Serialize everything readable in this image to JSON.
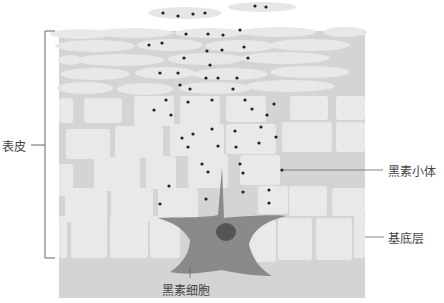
{
  "labels": {
    "epidermis": "表皮",
    "melanosome": "黑素小体",
    "basal_layer": "基底层",
    "melanocyte": "黑素细胞"
  },
  "colors": {
    "tissue_bg": "#d4d4d4",
    "cell_fill": "#e9e9e9",
    "melanocyte_fill": "#8a8a8a",
    "nucleus_fill": "#555555",
    "granule": "#222222",
    "line": "#666666",
    "text": "#444444"
  }
}
